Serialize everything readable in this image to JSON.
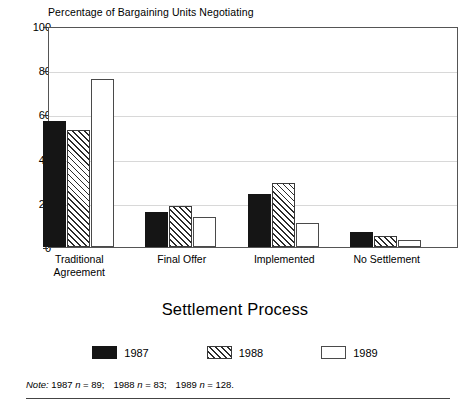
{
  "chart_data": {
    "type": "bar",
    "title": "Percentage of Bargaining Units Negotiating",
    "xlabel": "Settlement Process",
    "ylabel": "",
    "ylim": [
      0,
      100
    ],
    "yticks": [
      0,
      20,
      40,
      60,
      80,
      100
    ],
    "grid": true,
    "legend_position": "bottom",
    "categories": [
      "Traditional\nAgreement",
      "Final Offer",
      "Implemented",
      "No Settlement"
    ],
    "series": [
      {
        "name": "1987",
        "values": [
          57,
          16,
          24,
          7
        ],
        "color": "#151515",
        "fill": "solid"
      },
      {
        "name": "1988",
        "values": [
          53,
          18.5,
          29,
          5
        ],
        "color": "#ffffff",
        "fill": "diagonal-hatch"
      },
      {
        "name": "1989",
        "values": [
          76,
          13.5,
          11,
          3
        ],
        "color": "#ffffff",
        "fill": "empty"
      }
    ],
    "note": {
      "label": "Note:",
      "entries": [
        {
          "year": "1987",
          "n_symbol": "n",
          "n_value": "89"
        },
        {
          "year": "1988",
          "n_symbol": "n",
          "n_value": "83"
        },
        {
          "year": "1989",
          "n_symbol": "n",
          "n_value": "128"
        }
      ]
    }
  }
}
